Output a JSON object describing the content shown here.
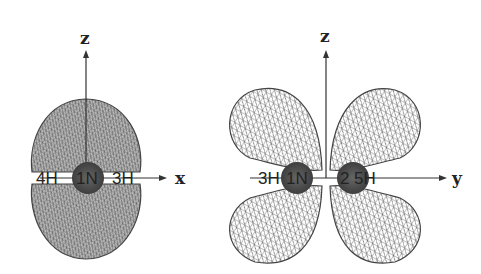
{
  "left_panel": {
    "axes": {
      "vertical": "z",
      "horizontal": "x"
    },
    "atoms": [
      "4H",
      "1N",
      "3H"
    ]
  },
  "right_panel": {
    "axes": {
      "vertical": "z",
      "horizontal": "y"
    },
    "atoms": [
      "3H",
      "1N",
      "2",
      "5H"
    ]
  },
  "colors": {
    "mesh": "#555555",
    "atom": "#4a4a4a",
    "axis": "#333333"
  }
}
